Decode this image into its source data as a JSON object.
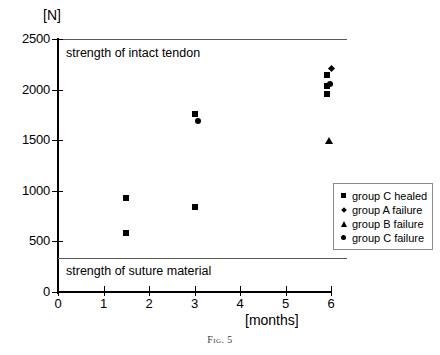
{
  "figure": {
    "caption": "Fig. 5"
  },
  "chart_data": {
    "type": "scatter",
    "title": "",
    "xlabel": "[months]",
    "ylabel": "[N]",
    "xlim": [
      0,
      6
    ],
    "ylim": [
      0,
      2500
    ],
    "xticks": [
      "0",
      "1",
      "2",
      "3",
      "4",
      "5",
      "6"
    ],
    "yticks": [
      "0",
      "500",
      "1000",
      "1500",
      "2000",
      "2500"
    ],
    "grid": false,
    "legend_position": "right",
    "series": [
      {
        "name": "group C healed",
        "marker": "square",
        "points": [
          {
            "x": 1.5,
            "y": 930
          },
          {
            "x": 1.5,
            "y": 580
          },
          {
            "x": 3.0,
            "y": 1755
          },
          {
            "x": 3.0,
            "y": 835
          },
          {
            "x": 5.92,
            "y": 2145
          },
          {
            "x": 5.92,
            "y": 2035
          },
          {
            "x": 5.92,
            "y": 1960
          }
        ]
      },
      {
        "name": "group A failure",
        "marker": "diamond",
        "points": [
          {
            "x": 6.02,
            "y": 2205
          }
        ]
      },
      {
        "name": "group B failure",
        "marker": "triangle",
        "points": [
          {
            "x": 5.95,
            "y": 1505
          }
        ]
      },
      {
        "name": "group C failure",
        "marker": "circle",
        "points": [
          {
            "x": 3.08,
            "y": 1690
          },
          {
            "x": 5.98,
            "y": 2060
          }
        ]
      }
    ],
    "reference_lines": [
      {
        "label": "strength of intact tendon",
        "y": 2500,
        "x_start": 0,
        "x_end": 6.35
      },
      {
        "label": "strength of suture material",
        "y": 335,
        "x_start": 0,
        "x_end": 6.35
      }
    ]
  }
}
